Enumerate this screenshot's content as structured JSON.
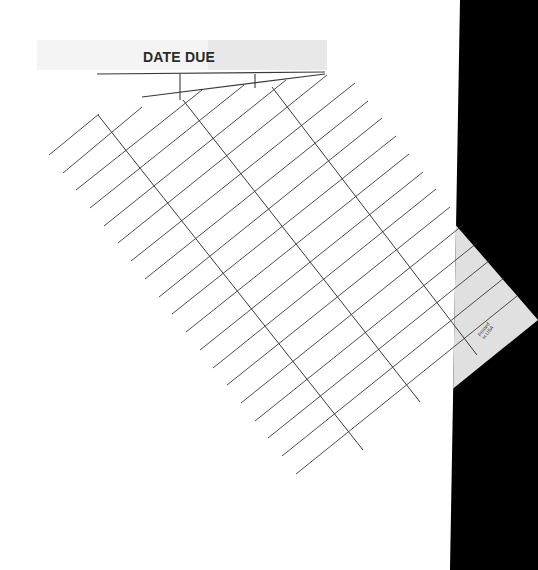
{
  "card": {
    "title": "DATE DUE",
    "imprint_line1": "Printed",
    "imprint_line2": "in USA"
  },
  "colors": {
    "background": "#ffffff",
    "scan_border": "#000000",
    "card_in_shadow": "#e0e0e0",
    "rule": "#3a3a3a",
    "header_band": "#f4f4f4",
    "header_band_dark": "#e8e8e8"
  },
  "scan_border_polygon": [
    [
      460,
      0
    ],
    [
      538,
      0
    ],
    [
      538,
      570
    ],
    [
      450,
      570
    ]
  ],
  "card_polygon": [
    [
      40,
      152
    ],
    [
      99,
      114
    ],
    [
      325,
      74
    ],
    [
      538,
      320
    ],
    [
      300,
      512
    ],
    [
      240,
      470
    ]
  ],
  "header_rules": [
    {
      "x1": 97,
      "y1": 74,
      "x2": 325,
      "y2": 72
    },
    {
      "x1": 142,
      "y1": 97,
      "x2": 325,
      "y2": 74
    },
    {
      "x1": 180,
      "y1": 74,
      "x2": 180,
      "y2": 100
    },
    {
      "x1": 255,
      "y1": 74,
      "x2": 255,
      "y2": 88
    }
  ],
  "row_rules": [
    {
      "x1": 49,
      "y1": 155,
      "x2": 99,
      "y2": 114
    },
    {
      "x1": 63,
      "y1": 173,
      "x2": 142,
      "y2": 107
    },
    {
      "x1": 76,
      "y1": 190,
      "x2": 202,
      "y2": 90
    },
    {
      "x1": 90,
      "y1": 208,
      "x2": 244,
      "y2": 85
    },
    {
      "x1": 104,
      "y1": 226,
      "x2": 286,
      "y2": 80
    },
    {
      "x1": 118,
      "y1": 243,
      "x2": 327,
      "y2": 75
    },
    {
      "x1": 131,
      "y1": 261,
      "x2": 355,
      "y2": 83
    },
    {
      "x1": 145,
      "y1": 279,
      "x2": 368,
      "y2": 101
    },
    {
      "x1": 159,
      "y1": 297,
      "x2": 382,
      "y2": 118
    },
    {
      "x1": 172,
      "y1": 314,
      "x2": 396,
      "y2": 136
    },
    {
      "x1": 186,
      "y1": 332,
      "x2": 409,
      "y2": 154
    },
    {
      "x1": 200,
      "y1": 350,
      "x2": 423,
      "y2": 172
    },
    {
      "x1": 213,
      "y1": 368,
      "x2": 436,
      "y2": 189
    },
    {
      "x1": 227,
      "y1": 385,
      "x2": 450,
      "y2": 207
    },
    {
      "x1": 241,
      "y1": 403,
      "x2": 463,
      "y2": 225
    },
    {
      "x1": 255,
      "y1": 421,
      "x2": 477,
      "y2": 243
    },
    {
      "x1": 268,
      "y1": 438,
      "x2": 490,
      "y2": 260
    },
    {
      "x1": 282,
      "y1": 456,
      "x2": 504,
      "y2": 278
    },
    {
      "x1": 296,
      "y1": 474,
      "x2": 517,
      "y2": 296
    }
  ],
  "column_rules": [
    {
      "x1": 98,
      "y1": 115,
      "x2": 363,
      "y2": 450
    },
    {
      "x1": 183,
      "y1": 100,
      "x2": 420,
      "y2": 402
    },
    {
      "x1": 272,
      "y1": 87,
      "x2": 477,
      "y2": 355
    }
  ]
}
